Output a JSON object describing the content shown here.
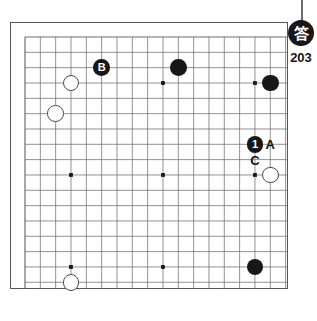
{
  "diagram": {
    "kind": "go-board-problem",
    "board_size": 19,
    "colors": {
      "black_stone": "#17171a",
      "white_stone": "#ffffff",
      "grid_line": "#6d6d72",
      "board_border": "#55555b",
      "label_text": "#111111"
    }
  },
  "badge": {
    "glyph": "答",
    "number": "203"
  },
  "stones": [
    {
      "id": "w1",
      "color": "white",
      "col": 3,
      "row": 3,
      "label": ""
    },
    {
      "id": "b-B",
      "color": "black",
      "col": 5,
      "row": 2,
      "label": "B"
    },
    {
      "id": "b1",
      "color": "black",
      "col": 10,
      "row": 2,
      "label": ""
    },
    {
      "id": "b2",
      "color": "black",
      "col": 16,
      "row": 3,
      "label": ""
    },
    {
      "id": "w2",
      "color": "white",
      "col": 2,
      "row": 5,
      "label": ""
    },
    {
      "id": "b-1",
      "color": "black",
      "col": 15,
      "row": 7,
      "label": "1"
    },
    {
      "id": "w3",
      "color": "white",
      "col": 16,
      "row": 9,
      "label": ""
    },
    {
      "id": "w4",
      "color": "white",
      "col": 3,
      "row": 16,
      "label": ""
    },
    {
      "id": "b3",
      "color": "black",
      "col": 15,
      "row": 15,
      "label": ""
    }
  ],
  "point_labels": [
    {
      "id": "A",
      "text": "A",
      "col": 16,
      "row": 7
    },
    {
      "id": "C",
      "text": "C",
      "col": 15,
      "row": 8
    }
  ],
  "star_points": [
    {
      "col": 3,
      "row": 3
    },
    {
      "col": 9,
      "row": 3
    },
    {
      "col": 15,
      "row": 3
    },
    {
      "col": 3,
      "row": 9
    },
    {
      "col": 9,
      "row": 9
    },
    {
      "col": 15,
      "row": 9
    },
    {
      "col": 3,
      "row": 15
    },
    {
      "col": 9,
      "row": 15
    },
    {
      "col": 15,
      "row": 15
    }
  ]
}
